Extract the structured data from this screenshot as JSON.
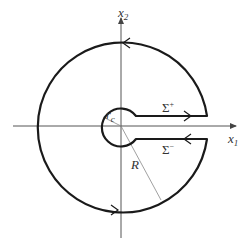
{
  "diagram": {
    "type": "keyhole contour",
    "labels": {
      "x2_axis": {
        "base": "x",
        "sub": "2"
      },
      "x1_axis": {
        "base": "x",
        "sub": "1"
      },
      "sigma_plus": {
        "base": "Σ",
        "sup": "+"
      },
      "sigma_minus": {
        "base": "Σ",
        "sup": "−"
      },
      "outer_radius": "R",
      "inner_radius": {
        "base": "r",
        "sub": "c"
      }
    },
    "geometry": {
      "center": [
        121,
        126
      ],
      "outer_radius_px": 85,
      "inner_radius_px": 19,
      "slot_half_width_px": 11
    },
    "colors": {
      "contour": "#1a1a1a",
      "axes": "#555555",
      "radius_lines": "#888888"
    }
  }
}
